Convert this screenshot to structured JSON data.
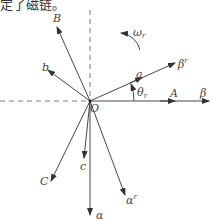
{
  "caption": "定了磁链。",
  "diagram": {
    "type": "vector-diagram",
    "origin_label": "O",
    "axes": {
      "horizontal_right": "β",
      "vertical_down": "α"
    },
    "stator_axes": {
      "A": "A",
      "B": "B",
      "C": "C"
    },
    "rotor_axes": {
      "a": "a",
      "b": "b",
      "c": "c"
    },
    "rotating_frame": {
      "beta_r": "β",
      "beta_r_sup": "r",
      "alpha_r": "α",
      "alpha_r_sup": "r"
    },
    "angle": {
      "symbol": "θ",
      "sub": "r"
    },
    "angular_velocity": {
      "symbol": "ω",
      "sub": "r"
    }
  }
}
